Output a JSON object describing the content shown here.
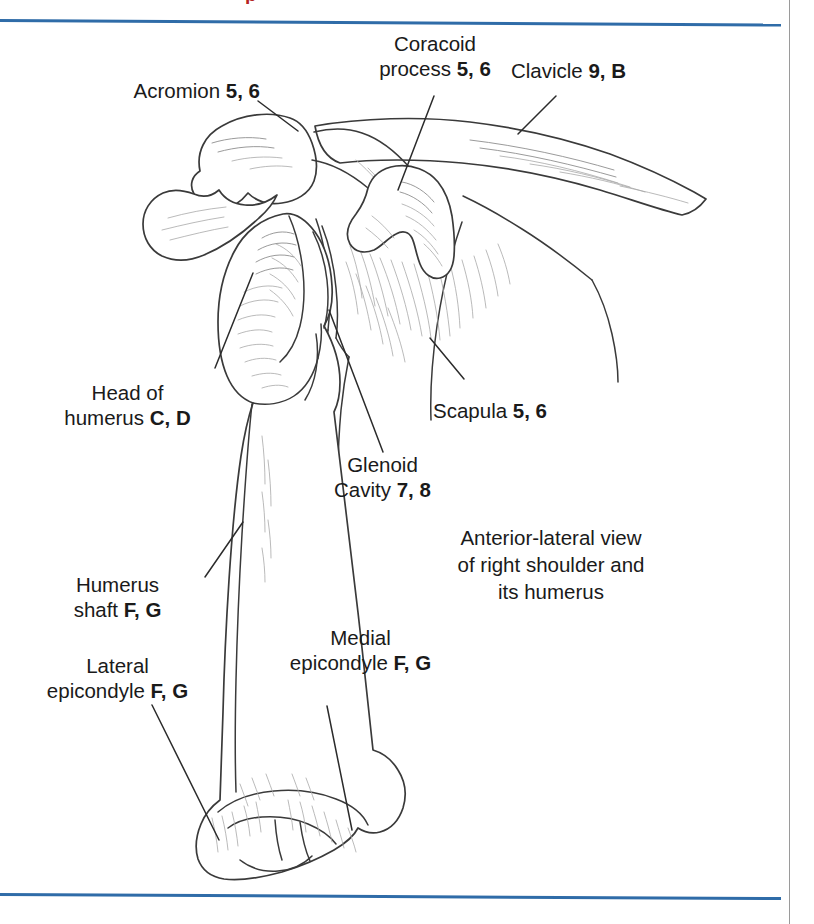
{
  "page": {
    "width": 814,
    "height": 924,
    "background": "#ffffff",
    "rule_color": "#2f6ca8",
    "vertical_rule_color": "#9a9a9a",
    "header_fragment_text": "p",
    "header_fragment_color": "#b42222",
    "ink_color": "#333333"
  },
  "figure": {
    "caption_lines": [
      "Anterior-lateral view",
      "of right shoulder and",
      "its humerus"
    ],
    "labels": [
      {
        "id": "acromion",
        "lines": [
          {
            "text": "Acromion ",
            "refs": "5, 6"
          }
        ],
        "align": "right"
      },
      {
        "id": "coracoid-process",
        "lines": [
          {
            "text": "Coracoid",
            "refs": ""
          },
          {
            "text": "process ",
            "refs": "5, 6"
          }
        ],
        "align": "center"
      },
      {
        "id": "clavicle",
        "lines": [
          {
            "text": "Clavicle ",
            "refs": "9, B"
          }
        ],
        "align": "left"
      },
      {
        "id": "head-of-humerus",
        "lines": [
          {
            "text": "Head of",
            "refs": ""
          },
          {
            "text": "humerus ",
            "refs": "C, D"
          }
        ],
        "align": "center"
      },
      {
        "id": "scapula",
        "lines": [
          {
            "text": "Scapula ",
            "refs": "5, 6"
          }
        ],
        "align": "left"
      },
      {
        "id": "glenoid-cavity",
        "lines": [
          {
            "text": "Glenoid",
            "refs": ""
          },
          {
            "text": "Cavity ",
            "refs": "7, 8"
          }
        ],
        "align": "center"
      },
      {
        "id": "humerus-shaft",
        "lines": [
          {
            "text": "Humerus",
            "refs": ""
          },
          {
            "text": "shaft ",
            "refs": "F, G"
          }
        ],
        "align": "center"
      },
      {
        "id": "lateral-epicondyle",
        "lines": [
          {
            "text": "Lateral",
            "refs": ""
          },
          {
            "text": "epicondyle ",
            "refs": "F, G"
          }
        ],
        "align": "center"
      },
      {
        "id": "medial-epicondyle",
        "lines": [
          {
            "text": "Medial",
            "refs": ""
          },
          {
            "text": "epicondyle ",
            "refs": "F, G"
          }
        ],
        "align": "center"
      }
    ]
  }
}
